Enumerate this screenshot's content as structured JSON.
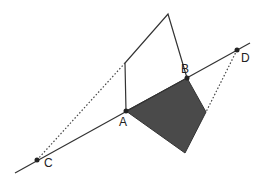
{
  "diagram": {
    "type": "geometry-reflection",
    "colors": {
      "line": "#333333",
      "shade": "#4a4a4a",
      "dots": "#222222",
      "background": "#ffffff"
    },
    "line": {
      "from": [
        15,
        173
      ],
      "to": [
        250,
        43
      ]
    },
    "points": {
      "A": {
        "label": "A",
        "pos": [
          126,
          111
        ],
        "label_pos": [
          119,
          126
        ]
      },
      "B": {
        "label": "B",
        "pos": [
          187,
          78
        ],
        "label_pos": [
          181,
          73
        ]
      },
      "C": {
        "label": "C",
        "pos": [
          37,
          160
        ],
        "label_pos": [
          44,
          167
        ]
      },
      "D": {
        "label": "D",
        "pos": [
          237,
          50
        ],
        "label_pos": [
          241,
          62
        ]
      }
    },
    "open_polygon": [
      [
        126,
        111
      ],
      [
        125,
        63
      ],
      [
        168,
        14
      ],
      [
        187,
        78
      ]
    ],
    "shaded_polygon": [
      [
        126,
        111
      ],
      [
        187,
        78
      ],
      [
        206,
        112
      ],
      [
        185,
        153
      ]
    ],
    "dotted_segments": [
      {
        "from": [
          37,
          160
        ],
        "to": [
          125,
          63
        ]
      },
      {
        "from": [
          237,
          50
        ],
        "to": [
          206,
          112
        ]
      }
    ]
  }
}
